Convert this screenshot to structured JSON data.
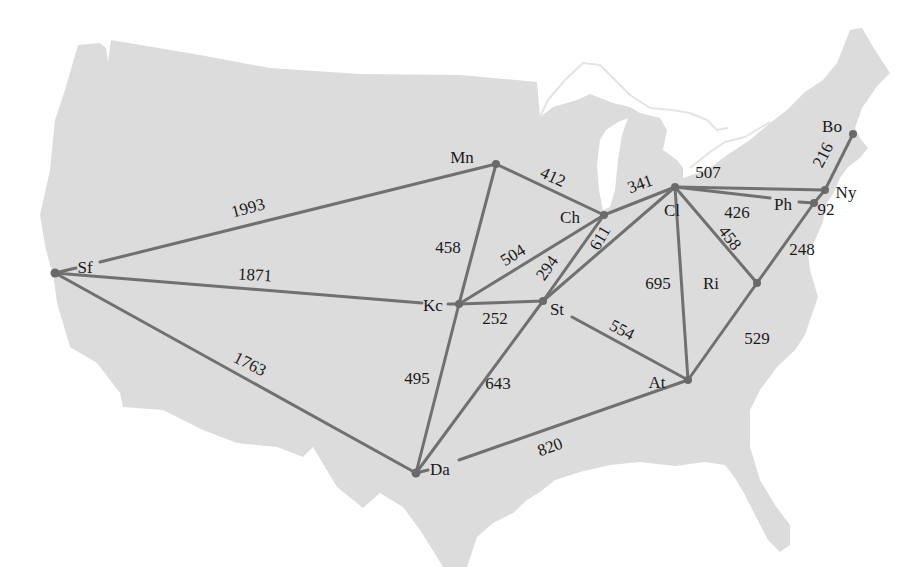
{
  "colors": {
    "land": "#dcdcdc",
    "water": "#ffffff",
    "edge": "#707070",
    "node": "#6a6a6a",
    "text": "#1a1a1a"
  },
  "cities": {
    "sf": "Sf",
    "mn": "Mn",
    "ch": "Ch",
    "cl": "Cl",
    "ny": "Ny",
    "ph": "Ph",
    "bo": "Bo",
    "ri": "Ri",
    "at": "At",
    "da": "Da",
    "kc": "Kc",
    "st": "St"
  },
  "edges": [
    {
      "from": "Sf",
      "to": "Mn",
      "distance": "1993"
    },
    {
      "from": "Sf",
      "to": "Kc",
      "distance": "1871"
    },
    {
      "from": "Sf",
      "to": "Da",
      "distance": "1763"
    },
    {
      "from": "Mn",
      "to": "Kc",
      "distance": "458"
    },
    {
      "from": "Mn",
      "to": "Ch",
      "distance": "412"
    },
    {
      "from": "Ch",
      "to": "Cl",
      "distance": "341"
    },
    {
      "from": "Ch",
      "to": "Kc",
      "distance": "504"
    },
    {
      "from": "Ch",
      "to": "St",
      "distance": "294"
    },
    {
      "from": "Cl",
      "to": "St",
      "distance": "611"
    },
    {
      "from": "Kc",
      "to": "St",
      "distance": "252"
    },
    {
      "from": "Kc",
      "to": "Da",
      "distance": "495"
    },
    {
      "from": "St",
      "to": "Da",
      "distance": "643"
    },
    {
      "from": "St",
      "to": "At",
      "distance": "554"
    },
    {
      "from": "Da",
      "to": "At",
      "distance": "820"
    },
    {
      "from": "Cl",
      "to": "Ny",
      "distance": "507"
    },
    {
      "from": "Cl",
      "to": "Ph",
      "distance": "426"
    },
    {
      "from": "Ph",
      "to": "Ny",
      "distance": "92"
    },
    {
      "from": "Bo",
      "to": "Ny",
      "distance": "216"
    },
    {
      "from": "Cl",
      "to": "Ri",
      "distance": "458"
    },
    {
      "from": "Cl",
      "to": "At",
      "distance": "695"
    },
    {
      "from": "Ph",
      "to": "Ri",
      "distance": "248"
    },
    {
      "from": "Ri",
      "to": "At",
      "distance": "529"
    }
  ]
}
